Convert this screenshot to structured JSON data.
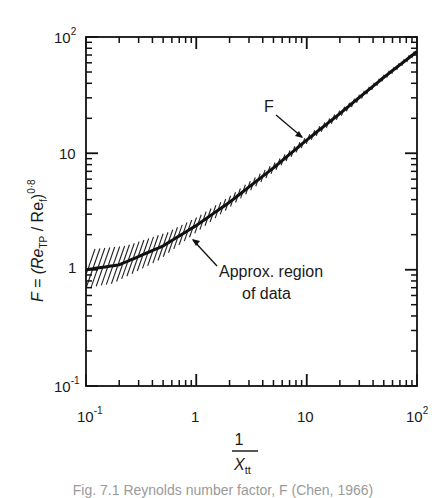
{
  "chart_data": {
    "type": "line",
    "title": "",
    "xlabel": "1 / X_tt",
    "ylabel": "F = (Re_TP / Re_f)^0.8",
    "xscale": "log",
    "yscale": "log",
    "xlim": [
      0.1,
      100
    ],
    "ylim": [
      0.1,
      100
    ],
    "grid": false,
    "legend": null,
    "x_ticks": [
      "10^-1",
      "1",
      "10",
      "10^2"
    ],
    "y_ticks": [
      "10^-1",
      "1",
      "10",
      "10^2"
    ],
    "series": [
      {
        "name": "F",
        "x": [
          0.1,
          0.2,
          0.5,
          1,
          2,
          5,
          10,
          20,
          50,
          100
        ],
        "values": [
          1.0,
          1.1,
          1.6,
          2.4,
          3.8,
          7.5,
          13,
          22,
          45,
          75
        ]
      }
    ],
    "band": {
      "name": "Approx. region of data",
      "x": [
        0.1,
        0.2,
        0.5,
        1,
        2,
        5,
        10,
        20,
        50,
        100
      ],
      "upper": [
        1.5,
        1.6,
        2.1,
        2.9,
        4.4,
        8.4,
        14.3,
        24,
        48,
        80
      ],
      "lower": [
        0.68,
        0.76,
        1.2,
        2.0,
        3.3,
        6.7,
        11.8,
        20,
        42,
        70
      ]
    },
    "annotations": [
      {
        "text": "F",
        "points_to": "curve",
        "at_x": 10
      },
      {
        "text": "Approx. region of data",
        "points_to": "hatched band",
        "at_x": 0.7
      }
    ]
  },
  "labels": {
    "y_tick_100": "10",
    "y_tick_100_exp": "2",
    "y_tick_10": "10",
    "y_tick_1": "1",
    "y_tick_01": "10",
    "y_tick_01_exp": "-1",
    "x_tick_01": "10",
    "x_tick_01_exp": "-1",
    "x_tick_1": "1",
    "x_tick_10": "10",
    "x_tick_100": "10",
    "x_tick_100_exp": "2",
    "x_title_num": "1",
    "x_title_den": "X",
    "x_title_sub": "tt",
    "y_title_main": "F = (Re",
    "y_title_sub1": "TP",
    "y_title_mid": " / Re",
    "y_title_sub2": "f",
    "y_title_close": ")",
    "y_title_exp": "0·8",
    "ann_f": "F",
    "ann_region_1": "Approx. region",
    "ann_region_2": "of data"
  },
  "caption": "Fig. 7.1  Reynolds number factor, F (Chen, 1966)"
}
